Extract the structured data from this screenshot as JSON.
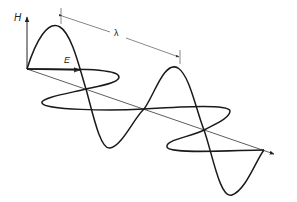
{
  "diagram": {
    "title": "",
    "labels": {
      "magnetic_axis": "H",
      "electric_axis": "E",
      "wavelength": "λ"
    },
    "colors": {
      "background": "#ffffff",
      "wave_stroke": "#1a1a1a",
      "axis_stroke": "#333333",
      "dimension_stroke": "#555555"
    },
    "components": [
      {
        "name": "H-wave",
        "orientation": "vertical",
        "cycles": 2
      },
      {
        "name": "E-wave",
        "orientation": "horizontal (in perspective)",
        "cycles": 2
      },
      {
        "name": "propagation-axis",
        "direction": "down-right"
      },
      {
        "name": "wavelength-dimension",
        "label": "λ",
        "spans": "one full cycle (peak to peak)"
      }
    ]
  }
}
